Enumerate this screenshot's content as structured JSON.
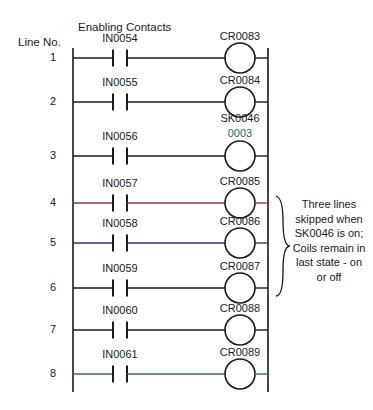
{
  "diagram": {
    "title_left": "Line No.",
    "title_contacts": "Enabling Contacts",
    "rails": {
      "left_x": 73,
      "right_x": 268,
      "top_y": 48,
      "bottom_y": 392
    },
    "rungs": [
      {
        "line_no": "1",
        "contact": "IN0054",
        "coil": "CR0083",
        "coil_sub": "",
        "y": 58,
        "wire_color": "#1a1a1a"
      },
      {
        "line_no": "2",
        "contact": "IN0055",
        "coil": "CR0084",
        "coil_sub": "",
        "y": 102,
        "wire_color": "#1a1a1a"
      },
      {
        "line_no": "3",
        "contact": "IN0056",
        "coil": "SK0046",
        "coil_sub": "0003",
        "y": 156,
        "wire_color": "#1a1a1a"
      },
      {
        "line_no": "4",
        "contact": "IN0057",
        "coil": "CR0085",
        "coil_sub": "",
        "y": 203,
        "wire_color": "#8c3a3a"
      },
      {
        "line_no": "5",
        "contact": "IN0058",
        "coil": "CR0086",
        "coil_sub": "",
        "y": 243,
        "wire_color": "#32327a"
      },
      {
        "line_no": "6",
        "contact": "IN0059",
        "coil": "CR0087",
        "coil_sub": "",
        "y": 288,
        "wire_color": "#1a1a1a"
      },
      {
        "line_no": "7",
        "contact": "IN0060",
        "coil": "CR0088",
        "coil_sub": "",
        "y": 330,
        "wire_color": "#1a1a1a"
      },
      {
        "line_no": "8",
        "contact": "IN0061",
        "coil": "CR0089",
        "coil_sub": "",
        "y": 374,
        "wire_color": "#3a6a6a"
      }
    ],
    "annotation": {
      "text": "Three lines\nskipped when\nSK0046 is on;\nCoils remain in\nlast state - on\nor off",
      "brace_from_y": 196,
      "brace_to_y": 296
    },
    "colors": {
      "ink": "#1a1a1a",
      "background": "#ffffff",
      "sk_sub_text": "#2d6b3f"
    }
  }
}
